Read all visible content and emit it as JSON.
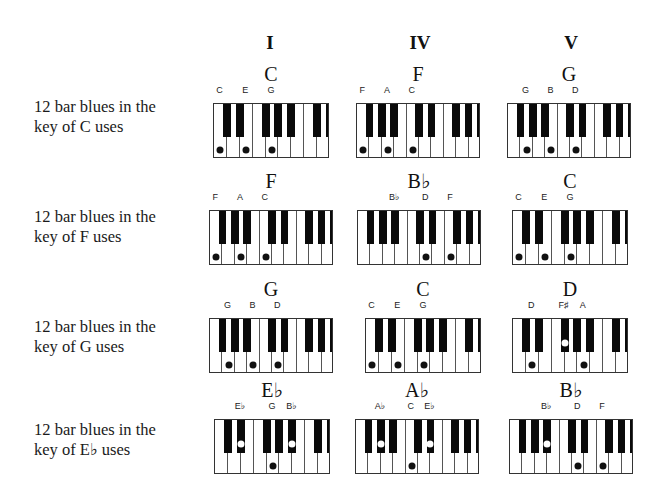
{
  "columns": [
    {
      "label": "I",
      "x": 270
    },
    {
      "label": "IV",
      "x": 420
    },
    {
      "label": "V",
      "x": 571
    }
  ],
  "rows": [
    {
      "label_line1": "12 bar blues in the",
      "label_line2": "key of C uses",
      "label_y": 97,
      "kbd_y": 103,
      "chords": [
        {
          "name": "C",
          "x": 213,
          "layout": "C",
          "notes": [
            {
              "label": "C",
              "white": 0
            },
            {
              "label": "E",
              "white": 2
            },
            {
              "label": "G",
              "white": 4
            }
          ]
        },
        {
          "name": "F",
          "x": 356,
          "layout": "F",
          "notes": [
            {
              "label": "F",
              "white": 0
            },
            {
              "label": "A",
              "white": 2
            },
            {
              "label": "C",
              "white": 4
            }
          ]
        },
        {
          "name": "G",
          "x": 507,
          "layout": "F",
          "notes": [
            {
              "label": "G",
              "white": 1
            },
            {
              "label": "B",
              "white": 3
            },
            {
              "label": "D",
              "white": 5
            }
          ]
        }
      ]
    },
    {
      "label_line1": "12 bar blues in the",
      "label_line2": "key of F uses",
      "label_y": 207,
      "kbd_y": 210,
      "chords": [
        {
          "name": "F",
          "x": 209,
          "layout": "F",
          "notes": [
            {
              "label": "F",
              "white": 0
            },
            {
              "label": "A",
              "white": 2
            },
            {
              "label": "C",
              "white": 4
            }
          ]
        },
        {
          "name": "B♭",
          "x": 357,
          "layout": "F",
          "notes": [
            {
              "label": "B♭",
              "black": 2,
              "nodot": true
            },
            {
              "label": "D",
              "white": 5
            },
            {
              "label": "F",
              "white": 7
            }
          ]
        },
        {
          "name": "C",
          "x": 512,
          "layout": "C",
          "notes": [
            {
              "label": "C",
              "white": 0
            },
            {
              "label": "E",
              "white": 2
            },
            {
              "label": "G",
              "white": 4
            }
          ]
        }
      ]
    },
    {
      "label_line1": "12 bar blues in the",
      "label_line2": "key of G uses",
      "label_y": 317,
      "kbd_y": 318,
      "chords": [
        {
          "name": "G",
          "x": 209,
          "layout": "F",
          "notes": [
            {
              "label": "G",
              "white": 1
            },
            {
              "label": "B",
              "white": 3
            },
            {
              "label": "D",
              "white": 5
            }
          ]
        },
        {
          "name": "C",
          "x": 365,
          "layout": "C",
          "notes": [
            {
              "label": "C",
              "white": 0
            },
            {
              "label": "E",
              "white": 2
            },
            {
              "label": "G",
              "white": 4
            }
          ]
        },
        {
          "name": "D",
          "x": 512,
          "layout": "C",
          "notes": [
            {
              "label": "D",
              "white": 1
            },
            {
              "label": "F♯",
              "black": 2
            },
            {
              "label": "A",
              "white": 5
            }
          ]
        }
      ]
    },
    {
      "label_line1": "12 bar blues in the",
      "label_line2": "key of E♭ uses",
      "label_y": 420,
      "kbd_y": 419,
      "chords": [
        {
          "name": "E♭",
          "x": 214,
          "layout": "C",
          "notes": [
            {
              "label": "E♭",
              "black": 1
            },
            {
              "label": "G",
              "white": 4
            },
            {
              "label": "B♭",
              "black": 4
            }
          ]
        },
        {
          "name": "A♭",
          "x": 355,
          "layout": "F",
          "notes": [
            {
              "label": "A♭",
              "black": 1
            },
            {
              "label": "C",
              "white": 4
            },
            {
              "label": "E♭",
              "black": 4
            }
          ]
        },
        {
          "name": "B♭",
          "x": 509,
          "layout": "F",
          "notes": [
            {
              "label": "B♭",
              "black": 2
            },
            {
              "label": "D",
              "white": 5
            },
            {
              "label": "F",
              "white": 7
            }
          ]
        }
      ]
    }
  ],
  "layouts": {
    "C": {
      "whites": 9,
      "width": 116,
      "blacks_after_white": [
        0,
        1,
        3,
        4,
        5,
        7,
        8
      ]
    },
    "F": {
      "whites": 10,
      "width": 124,
      "blacks_after_white": [
        0,
        1,
        2,
        4,
        5,
        7,
        8,
        9
      ]
    }
  },
  "keyboard_height": 55,
  "black_key_height": 33
}
